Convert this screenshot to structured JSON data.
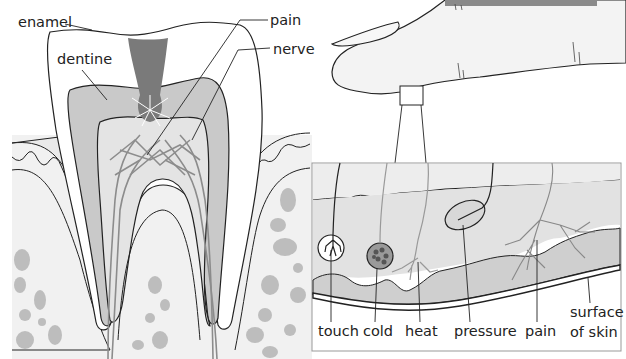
{
  "tooth_diagram": {
    "labels": {
      "enamel": "enamel",
      "dentine": "dentine",
      "pain": "pain",
      "nerve": "nerve"
    }
  },
  "finger_diagram": {
    "inset_labels": {
      "touch": "touch",
      "cold": "cold",
      "heat": "heat",
      "pressure": "pressure",
      "pain": "pain",
      "surface_line1": "surface",
      "surface_line2": "of skin"
    }
  },
  "colors": {
    "background": "#ffffff",
    "line": "#222222",
    "dentine_fill": "#c9c9c9",
    "pulp_fill": "#e4e4e4",
    "gum_fill": "#ececec",
    "decay_fill": "#7a7a7a",
    "skin_fill": "#f0f0f0",
    "dermis_fill": "#e2e2e2",
    "hypodermis_fill": "#cfcfcf",
    "top_bar": "#8a8a8a"
  }
}
